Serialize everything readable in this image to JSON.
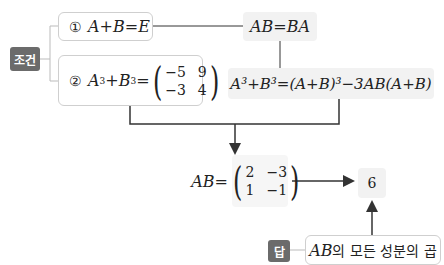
{
  "condition_badge": "조건",
  "answer_badge": "답",
  "condition1": {
    "num": "①",
    "expr": "A+B=E"
  },
  "condition2": {
    "num": "②",
    "lhs_a": "A",
    "exp_a": "3",
    "plus": "+",
    "lhs_b": "B",
    "exp_b": "3",
    "eq": "=",
    "matrix": [
      [
        "−5",
        "9"
      ],
      [
        "−3",
        "4"
      ]
    ]
  },
  "commute": "AB=BA",
  "identity": "A³+B³=(A+B)³−3AB(A+B)",
  "ab_result": {
    "lhs": "AB=",
    "matrix": [
      [
        "2",
        "−3"
      ],
      [
        "1",
        "−1"
      ]
    ]
  },
  "final_value": "6",
  "answer_text": {
    "math": "AB",
    "rest": "의 모든 성분의 곱"
  },
  "colors": {
    "badge": "#6b6b6b",
    "box_fill": "#f2f2f2",
    "box_border": "#cfcfcf",
    "line": "#333333"
  }
}
